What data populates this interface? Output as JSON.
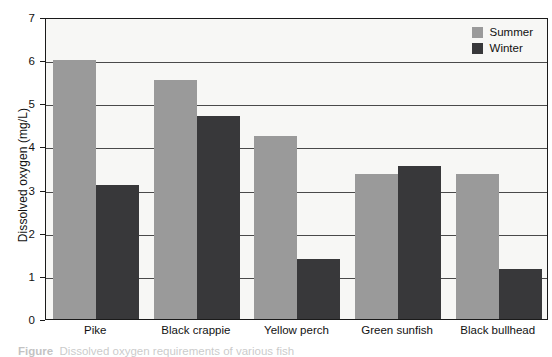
{
  "chart_data": {
    "type": "bar",
    "title": "",
    "xlabel": "",
    "ylabel": "Dissolved oxygen (mg/L)",
    "ylim": [
      0,
      7
    ],
    "yticks": [
      0,
      1,
      2,
      3,
      4,
      5,
      6,
      7
    ],
    "grid": true,
    "legend_position": "top-right",
    "categories": [
      "Pike",
      "Black crappie",
      "Yellow perch",
      "Green sunfish",
      "Black bullhead"
    ],
    "series": [
      {
        "name": "Summer",
        "color": "#9a9a9a",
        "values": [
          6.0,
          5.55,
          4.25,
          3.35,
          3.35
        ]
      },
      {
        "name": "Winter",
        "color": "#38383a",
        "values": [
          3.1,
          4.7,
          1.4,
          3.55,
          1.15
        ]
      }
    ]
  },
  "legend": {
    "items": [
      {
        "label": "Summer",
        "swatch": "summer"
      },
      {
        "label": "Winter",
        "swatch": "winter"
      }
    ]
  },
  "caption": {
    "text": "Dissolved oxygen requirements of various fish"
  },
  "colors": {
    "summer": "#9a9a9a",
    "winter": "#38383a",
    "plot_background": "#f7f7f5",
    "axis": "#1a1a1a"
  }
}
